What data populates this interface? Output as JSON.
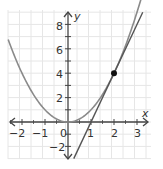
{
  "chart_data": {
    "type": "line",
    "title": "",
    "xlabel": "x",
    "ylabel": "y",
    "xlim": [
      -2.6,
      3.6
    ],
    "ylim": [
      -3,
      9
    ],
    "grid": true,
    "x_ticks": [
      "-2",
      "-1",
      "0",
      "1",
      "2",
      "3"
    ],
    "y_ticks": [
      "-2",
      "2",
      "4",
      "6",
      "8"
    ],
    "origin_label": "0",
    "series": [
      {
        "name": "y = x^2",
        "kind": "curve",
        "x": [
          -2.6,
          -2,
          -1,
          0,
          1,
          2,
          3
        ],
        "y": [
          6.76,
          4,
          1,
          0,
          1,
          4,
          9
        ],
        "color": "#8a8a8a"
      },
      {
        "name": "tangent y = 4x - 4",
        "kind": "line",
        "x": [
          0.25,
          3.25
        ],
        "y": [
          -3,
          9
        ],
        "color": "#555555"
      }
    ],
    "points": [
      {
        "x": 2,
        "y": 4,
        "color": "#111111"
      }
    ]
  },
  "labels": {
    "x_axis": "x",
    "y_axis": "y",
    "origin": "0",
    "xt": [
      "−2",
      "−1",
      "1",
      "2",
      "3"
    ],
    "yt": [
      "8",
      "6",
      "4",
      "2",
      "−2"
    ]
  },
  "colors": {
    "grid": "#e6e6e6",
    "axis": "#444444",
    "parabola": "#8a8a8a",
    "tangent": "#555555",
    "point": "#111111"
  }
}
